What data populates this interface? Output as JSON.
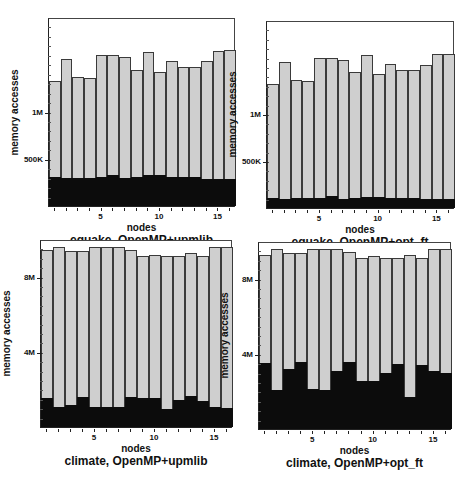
{
  "chart_data": [
    {
      "type": "bar",
      "stacked": true,
      "title": "equake, OpenMP+upmlib",
      "xlabel": "nodes",
      "ylabel": "memory accesses",
      "categories": [
        1,
        2,
        3,
        4,
        5,
        6,
        7,
        8,
        9,
        10,
        11,
        12,
        13,
        14,
        15,
        16
      ],
      "xticks": [
        "5",
        "10",
        "15"
      ],
      "yticks": [
        {
          "value": 500000,
          "label": "500K"
        },
        {
          "value": 1000000,
          "label": "1M"
        }
      ],
      "ylim": [
        0,
        2000000
      ],
      "series": [
        {
          "name": "dark (lower segment)",
          "color": "#0c0c0c",
          "values": [
            305000,
            300000,
            300000,
            300000,
            305000,
            325000,
            295000,
            310000,
            325000,
            325000,
            310000,
            305000,
            305000,
            285000,
            285000,
            285000
          ]
        },
        {
          "name": "total",
          "color": "#cfcfcf",
          "values": [
            1330000,
            1560000,
            1370000,
            1360000,
            1610000,
            1610000,
            1580000,
            1450000,
            1640000,
            1430000,
            1540000,
            1480000,
            1480000,
            1540000,
            1650000,
            1660000
          ]
        }
      ],
      "grid": false,
      "legend": "none"
    },
    {
      "type": "bar",
      "stacked": true,
      "title": "equake, OpenMP+opt_ft",
      "xlabel": "nodes",
      "ylabel": "memory accesses",
      "categories": [
        1,
        2,
        3,
        4,
        5,
        6,
        7,
        8,
        9,
        10,
        11,
        12,
        13,
        14,
        15,
        16
      ],
      "xticks": [
        "5",
        "10",
        "15"
      ],
      "yticks": [
        {
          "value": 500000,
          "label": "500K"
        },
        {
          "value": 1000000,
          "label": "1M"
        }
      ],
      "ylim": [
        0,
        2000000
      ],
      "series": [
        {
          "name": "dark (lower segment)",
          "color": "#0c0c0c",
          "values": [
            110000,
            100000,
            105000,
            105000,
            110000,
            125000,
            100000,
            110000,
            120000,
            120000,
            110000,
            105000,
            105000,
            95000,
            95000,
            95000
          ]
        },
        {
          "name": "total",
          "color": "#cfcfcf",
          "values": [
            1330000,
            1560000,
            1370000,
            1360000,
            1600000,
            1600000,
            1580000,
            1460000,
            1640000,
            1430000,
            1540000,
            1480000,
            1480000,
            1530000,
            1650000,
            1650000
          ]
        }
      ],
      "grid": false,
      "legend": "none"
    },
    {
      "type": "bar",
      "stacked": true,
      "title": "climate, OpenMP+upmlib",
      "xlabel": "nodes",
      "ylabel": "memory accesses",
      "categories": [
        1,
        2,
        3,
        4,
        5,
        6,
        7,
        8,
        9,
        10,
        11,
        12,
        13,
        14,
        15,
        16
      ],
      "xticks": [
        "5",
        "10",
        "15"
      ],
      "yticks": [
        {
          "value": 4000000,
          "label": "4M"
        },
        {
          "value": 8000000,
          "label": "8M"
        }
      ],
      "ylim": [
        0,
        10000000
      ],
      "series": [
        {
          "name": "dark (lower segment)",
          "color": "#0c0c0c",
          "values": [
            1550000,
            1070000,
            1170000,
            1600000,
            1070000,
            1070000,
            1070000,
            1600000,
            1550000,
            1550000,
            960000,
            1440000,
            1650000,
            1390000,
            1070000,
            1010000
          ]
        },
        {
          "name": "total",
          "color": "#cfcfcf",
          "values": [
            9440000,
            9600000,
            9390000,
            9390000,
            9650000,
            9600000,
            9600000,
            9440000,
            9120000,
            9200000,
            9120000,
            9170000,
            9280000,
            9120000,
            9600000,
            9600000
          ]
        }
      ],
      "grid": false,
      "legend": "none"
    },
    {
      "type": "bar",
      "stacked": true,
      "title": "climate, OpenMP+opt_ft",
      "xlabel": "nodes",
      "ylabel": "memory accesses",
      "categories": [
        1,
        2,
        3,
        4,
        5,
        6,
        7,
        8,
        9,
        10,
        11,
        12,
        13,
        14,
        15,
        16
      ],
      "xticks": [
        "5",
        "10",
        "15"
      ],
      "yticks": [
        {
          "value": 4000000,
          "label": "4M"
        },
        {
          "value": 8000000,
          "label": "8M"
        }
      ],
      "ylim": [
        0,
        10000000
      ],
      "series": [
        {
          "name": "dark (lower segment)",
          "color": "#0c0c0c",
          "values": [
            3520000,
            2080000,
            3200000,
            3570000,
            2130000,
            2080000,
            3090000,
            3570000,
            2560000,
            2560000,
            2990000,
            3470000,
            1710000,
            3410000,
            3090000,
            2990000
          ]
        },
        {
          "name": "total",
          "color": "#cfcfcf",
          "values": [
            9330000,
            9600000,
            9390000,
            9390000,
            9600000,
            9600000,
            9600000,
            9440000,
            9120000,
            9230000,
            9120000,
            9170000,
            9280000,
            9120000,
            9600000,
            9600000
          ]
        }
      ],
      "grid": false,
      "legend": "none"
    }
  ],
  "panels": [
    {
      "caption": "equake, OpenMP+upmlib",
      "xlabel": "nodes",
      "ylabel": "memory accesses",
      "ytick_labels": [
        "500K",
        "1M"
      ],
      "xtick_labels": [
        "5",
        "10",
        "15"
      ]
    },
    {
      "caption": "equake, OpenMP+opt_ft",
      "xlabel": "nodes",
      "ylabel": "memory accesses",
      "ytick_labels": [
        "500K",
        "1M"
      ],
      "xtick_labels": [
        "5",
        "10",
        "15"
      ]
    },
    {
      "caption": "climate, OpenMP+upmlib",
      "xlabel": "nodes",
      "ylabel": "memory accesses",
      "ytick_labels": [
        "4M",
        "8M"
      ],
      "xtick_labels": [
        "5",
        "10",
        "15"
      ]
    },
    {
      "caption": "climate, OpenMP+opt_ft",
      "xlabel": "nodes",
      "ylabel": "memory accesses",
      "ytick_labels": [
        "4M",
        "8M"
      ],
      "xtick_labels": [
        "5",
        "10",
        "15"
      ]
    }
  ]
}
